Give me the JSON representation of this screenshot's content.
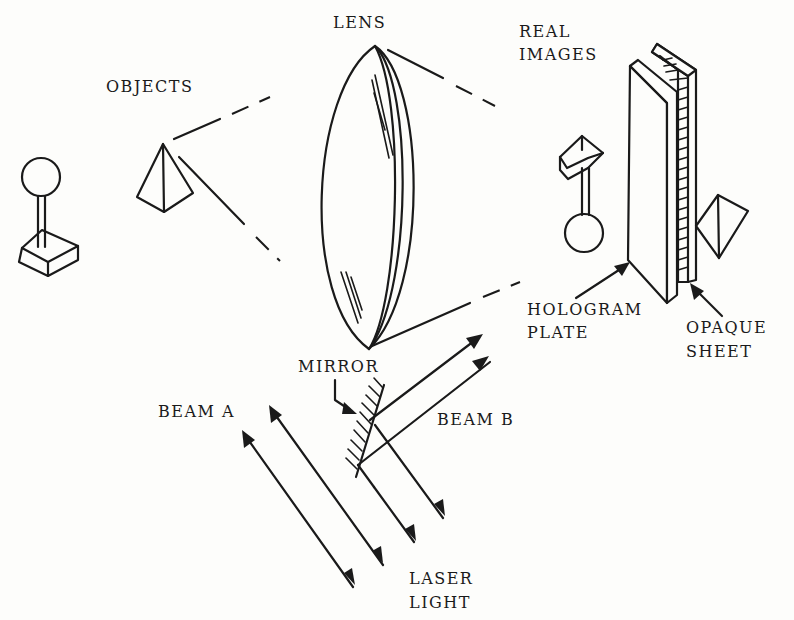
{
  "diagram": {
    "type": "hologram-recording-setup",
    "labels": {
      "objects": "OBJECTS",
      "lens": "LENS",
      "real_images_line1": "REAL",
      "real_images_line2": "IMAGES",
      "hologram_plate_line1": "HOLOGRAM",
      "hologram_plate_line2": "PLATE",
      "opaque_sheet_line1": "OPAQUE",
      "opaque_sheet_line2": "SHEET",
      "mirror": "MIRROR",
      "beam_a": "BEAM A",
      "beam_b": "BEAM B",
      "laser_line1": "LASER",
      "laser_line2": "LIGHT"
    },
    "components": [
      {
        "name": "sphere-on-stand-object",
        "role": "object"
      },
      {
        "name": "pyramid-object",
        "role": "object"
      },
      {
        "name": "lens",
        "role": "optics"
      },
      {
        "name": "inverted-sphere-stand-image",
        "role": "real image"
      },
      {
        "name": "inverted-pyramid-image",
        "role": "real image"
      },
      {
        "name": "hologram-plate",
        "role": "recording medium"
      },
      {
        "name": "opaque-sheet",
        "role": "backing"
      },
      {
        "name": "mirror",
        "role": "beam splitter"
      },
      {
        "name": "laser-beams",
        "role": "light source",
        "count": 4
      }
    ],
    "colors": {
      "ink": "#1a1a1a",
      "paper": "#fdfdfb"
    }
  }
}
